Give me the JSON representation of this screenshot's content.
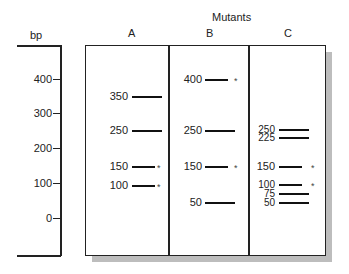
{
  "title": "Mutants",
  "ladder": {
    "label": "bp",
    "ticks": [
      {
        "label": "400",
        "y": 79
      },
      {
        "label": "300",
        "y": 113
      },
      {
        "label": "200",
        "y": 148
      },
      {
        "label": "100",
        "y": 183
      },
      {
        "label": "0",
        "y": 218
      }
    ]
  },
  "lanes": [
    {
      "label": "A",
      "bands": [
        {
          "size": "350",
          "y": 96,
          "star": false
        },
        {
          "size": "250",
          "y": 130,
          "star": false
        },
        {
          "size": "150",
          "y": 166,
          "star": true
        },
        {
          "size": "100",
          "y": 185,
          "star": true
        }
      ]
    },
    {
      "label": "B",
      "bands": [
        {
          "size": "400",
          "y": 79,
          "star": true
        },
        {
          "size": "250",
          "y": 130,
          "star": false
        },
        {
          "size": "150",
          "y": 166,
          "star": true
        },
        {
          "size": "50",
          "y": 202,
          "star": false
        }
      ]
    },
    {
      "label": "C",
      "bands": [
        {
          "size": "250",
          "y": 129,
          "star": false
        },
        {
          "size": "225",
          "y": 137,
          "star": false
        },
        {
          "size": "150",
          "y": 166,
          "star": true
        },
        {
          "size": "100",
          "y": 184,
          "star": true
        },
        {
          "size": "75",
          "y": 193,
          "star": false
        },
        {
          "size": "50",
          "y": 202,
          "star": false
        }
      ]
    }
  ],
  "star_symbol": "*"
}
